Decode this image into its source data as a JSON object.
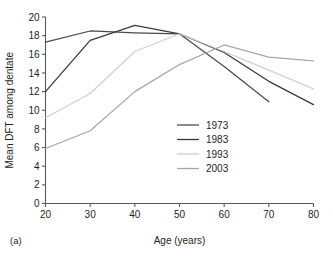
{
  "figure": {
    "panel_label": "(a)"
  },
  "chart_data": {
    "type": "line",
    "title": "",
    "xlabel": "Age (years)",
    "ylabel": "Mean DFT among dentate",
    "x": [
      20,
      30,
      40,
      50,
      60,
      70,
      80
    ],
    "xlim": [
      20,
      80
    ],
    "ylim": [
      0,
      20
    ],
    "xticks": [
      20,
      30,
      40,
      50,
      60,
      70,
      80
    ],
    "yticks": [
      0,
      2,
      4,
      6,
      8,
      10,
      12,
      14,
      16,
      18,
      20
    ],
    "xtick_labels": [
      "20",
      "30",
      "40",
      "50",
      "60",
      "70",
      "80"
    ],
    "ytick_labels": [
      "0",
      "2",
      "4",
      "6",
      "8",
      "10",
      "12",
      "14",
      "16",
      "18",
      "20"
    ],
    "grid": false,
    "legend_position": "center-right-inside",
    "series": [
      {
        "name": "1973",
        "color": "#4a4a4a",
        "x": [
          20,
          30,
          40,
          50,
          60,
          70
        ],
        "values": [
          17.3,
          18.5,
          18.3,
          18.2,
          14.7,
          10.9
        ]
      },
      {
        "name": "1983",
        "color": "#3a3a3a",
        "x": [
          20,
          30,
          40,
          50,
          60,
          70,
          80
        ],
        "values": [
          12.0,
          17.5,
          19.1,
          18.2,
          16.2,
          13.1,
          10.6
        ]
      },
      {
        "name": "1993",
        "color": "#d0d0d0",
        "x": [
          20,
          30,
          40,
          50,
          60,
          70,
          80
        ],
        "values": [
          9.2,
          11.8,
          16.3,
          18.2,
          16.3,
          14.3,
          12.3
        ]
      },
      {
        "name": "2003",
        "color": "#a6a6a6",
        "x": [
          20,
          30,
          40,
          50,
          60,
          70,
          80
        ],
        "values": [
          5.9,
          7.8,
          12.0,
          14.9,
          17.0,
          15.7,
          15.3
        ]
      }
    ]
  }
}
